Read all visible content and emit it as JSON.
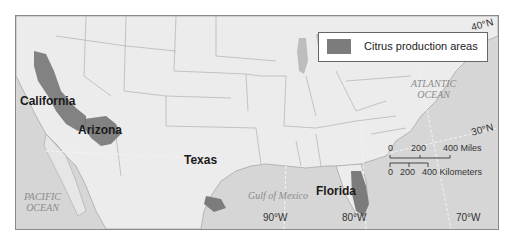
{
  "map": {
    "title": "Citrus production areas in the United States",
    "legend": {
      "label": "Citrus production areas",
      "swatch_color": "#7c7c7c"
    },
    "states_labeled": [
      {
        "name": "California"
      },
      {
        "name": "Arizona"
      },
      {
        "name": "Texas"
      },
      {
        "name": "Florida"
      }
    ],
    "water_bodies": {
      "pacific": [
        "PACIFIC",
        "OCEAN"
      ],
      "atlantic": [
        "ATLANTIC",
        "OCEAN"
      ],
      "gulf": "Gulf of Mexico"
    },
    "latitudes": [
      "40°N",
      "30°N"
    ],
    "longitudes": [
      "90°W",
      "80°W",
      "70°W"
    ],
    "scale_bar": {
      "miles": [
        "0",
        "200",
        "400 Miles"
      ],
      "kilometers": [
        "0",
        "200",
        "400 Kilometers"
      ]
    },
    "colors": {
      "land": "#ececec",
      "water": "#d6d6d6",
      "citrus": "#7c7c7c",
      "border": "#9a9a9a"
    }
  }
}
